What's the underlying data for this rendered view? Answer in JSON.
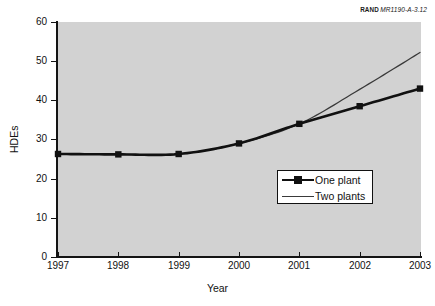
{
  "source": {
    "mark": "RAND",
    "code": "MR1190-A-3.12"
  },
  "axes": {
    "ylabel": "HDEs",
    "xlabel": "Year",
    "yticks": [
      "0",
      "10",
      "20",
      "30",
      "40",
      "50",
      "60"
    ],
    "xticks": [
      "1997",
      "1998",
      "1999",
      "2000",
      "2001",
      "2002",
      "2003"
    ]
  },
  "legend": {
    "items": [
      {
        "label": "One plant",
        "style": "thick-marker"
      },
      {
        "label": "Two plants",
        "style": "thin"
      }
    ]
  },
  "colors": {
    "plot_background": "#d2d2d2",
    "page_background": "#ffffff",
    "axis": "#141414",
    "series_one_plant": "#111111",
    "series_two_plants": "#3a3a3a"
  },
  "chart_data": {
    "type": "line",
    "title": "",
    "subtitle": "",
    "xlabel": "Year",
    "ylabel": "HDEs",
    "x": [
      1997,
      1998,
      1999,
      2000,
      2001,
      2002,
      2003
    ],
    "xlim": [
      1997,
      2003
    ],
    "ylim": [
      0,
      60
    ],
    "ytick_step": 10,
    "grid": false,
    "legend_position": "center-right-inside",
    "series": [
      {
        "name": "One plant",
        "values": [
          26.3,
          26.2,
          26.3,
          29.0,
          34.0,
          38.5,
          43.0
        ],
        "markers": "square",
        "line_width": "thick",
        "color": "#111111"
      },
      {
        "name": "Two plants",
        "values": [
          26.3,
          26.2,
          26.3,
          29.0,
          34.0,
          42.8,
          52.2
        ],
        "markers": "none",
        "line_width": "thin",
        "color": "#3a3a3a"
      }
    ]
  }
}
